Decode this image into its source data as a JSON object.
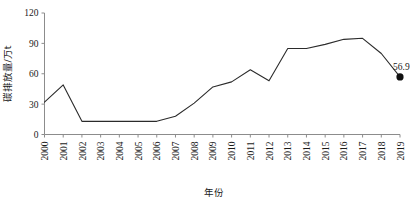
{
  "chart_data": {
    "type": "line",
    "title": "",
    "xlabel": "年份",
    "ylabel": "碳排放量/万t",
    "grid": false,
    "legend": false,
    "xlim": [
      2000,
      2019
    ],
    "ylim": [
      0,
      120
    ],
    "ytick_labels": [
      "0",
      "30",
      "60",
      "90",
      "120"
    ],
    "yticks": [
      0,
      30,
      60,
      90,
      120
    ],
    "categories": [
      "2000",
      "2001",
      "2002",
      "2003",
      "2004",
      "2005",
      "2006",
      "2007",
      "2008",
      "2009",
      "2010",
      "2011",
      "2012",
      "2013",
      "2014",
      "2015",
      "2016",
      "2017",
      "2018",
      "2019"
    ],
    "values": [
      32,
      49,
      13,
      13,
      13,
      13,
      13,
      18,
      31,
      47,
      52,
      64,
      53,
      85,
      85,
      89,
      94,
      95,
      80,
      56.9
    ],
    "annotations": [
      {
        "label": "56.9",
        "x": "2019",
        "y": 56.9,
        "marker": "filled-circle"
      }
    ]
  },
  "axis": {
    "y_title": "碳排放量/万t",
    "x_title": "年份"
  }
}
